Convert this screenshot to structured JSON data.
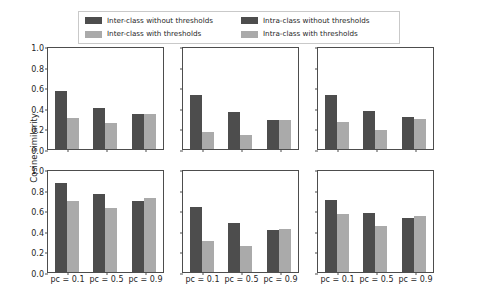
{
  "chart_data": {
    "type": "bar",
    "title": "",
    "xlabel": "",
    "ylabel": "Cosine similarity",
    "ylim": [
      0.0,
      1.0
    ],
    "ytick_labels": [
      "0.0",
      "0.2",
      "0.4",
      "0.6",
      "0.8",
      "1.0"
    ],
    "ytick_values": [
      0.0,
      0.2,
      0.4,
      0.6,
      0.8,
      1.0
    ],
    "categories": [
      "pc = 0.1",
      "pc = 0.5",
      "pc = 0.9"
    ],
    "grid": false,
    "legend_position": "top-center",
    "legend": [
      {
        "label": "Inter-class without thresholds",
        "color": "#4d4d4d"
      },
      {
        "label": "Inter-class with thresholds",
        "color": "#aaaaaa"
      },
      {
        "label": "Intra-class without thresholds",
        "color": "#4d4d4d"
      },
      {
        "label": "Intra-class with thresholds",
        "color": "#aaaaaa"
      }
    ],
    "subplots": [
      {
        "name": "top-left",
        "row": 0,
        "col": 0,
        "series": [
          {
            "name": "without thresholds",
            "color": "#4d4d4d",
            "values": [
              0.56,
              0.4,
              0.34
            ]
          },
          {
            "name": "with thresholds",
            "color": "#aaaaaa",
            "values": [
              0.3,
              0.25,
              0.34
            ]
          }
        ]
      },
      {
        "name": "top-middle",
        "row": 0,
        "col": 1,
        "series": [
          {
            "name": "without thresholds",
            "color": "#4d4d4d",
            "values": [
              0.52,
              0.36,
              0.28
            ]
          },
          {
            "name": "with thresholds",
            "color": "#aaaaaa",
            "values": [
              0.17,
              0.14,
              0.28
            ]
          }
        ]
      },
      {
        "name": "top-right",
        "row": 0,
        "col": 2,
        "series": [
          {
            "name": "without thresholds",
            "color": "#4d4d4d",
            "values": [
              0.52,
              0.37,
              0.31
            ]
          },
          {
            "name": "with thresholds",
            "color": "#aaaaaa",
            "values": [
              0.26,
              0.18,
              0.29
            ]
          }
        ]
      },
      {
        "name": "bottom-left",
        "row": 1,
        "col": 0,
        "series": [
          {
            "name": "without thresholds",
            "color": "#4d4d4d",
            "values": [
              0.86,
              0.76,
              0.69
            ]
          },
          {
            "name": "with thresholds",
            "color": "#aaaaaa",
            "values": [
              0.69,
              0.62,
              0.72
            ]
          }
        ]
      },
      {
        "name": "bottom-middle",
        "row": 1,
        "col": 1,
        "series": [
          {
            "name": "without thresholds",
            "color": "#4d4d4d",
            "values": [
              0.63,
              0.48,
              0.41
            ]
          },
          {
            "name": "with thresholds",
            "color": "#aaaaaa",
            "values": [
              0.3,
              0.25,
              0.42
            ]
          }
        ]
      },
      {
        "name": "bottom-right",
        "row": 1,
        "col": 2,
        "series": [
          {
            "name": "without thresholds",
            "color": "#4d4d4d",
            "values": [
              0.7,
              0.57,
              0.52
            ]
          },
          {
            "name": "with thresholds",
            "color": "#aaaaaa",
            "values": [
              0.56,
              0.45,
              0.54
            ]
          }
        ]
      }
    ]
  }
}
